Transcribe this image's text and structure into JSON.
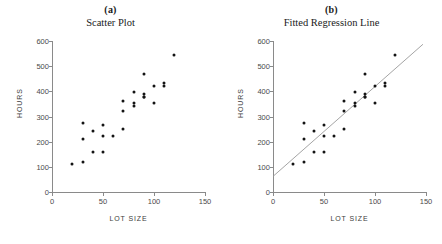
{
  "figure": {
    "background": "#ffffff",
    "point_color": "#141414",
    "axis_color": "#8a8a8a",
    "line_color": "#9a9a9a"
  },
  "panels": [
    {
      "letter": "(a)",
      "title": "Scatter Plot",
      "show_line": false
    },
    {
      "letter": "(b)",
      "title": "Fitted Regression Line",
      "show_line": true
    }
  ],
  "axes": {
    "xlabel": "LOT SIZE",
    "ylabel": "HOURS",
    "xlim": [
      0,
      150
    ],
    "ylim": [
      0,
      600
    ],
    "xticks": [
      0,
      50,
      100,
      150
    ],
    "xticklabels": [
      "0",
      "50",
      "100",
      "150"
    ],
    "yticks": [
      0,
      100,
      200,
      300,
      400,
      500,
      600
    ],
    "yticklabels": [
      "0",
      "100",
      "200",
      "300",
      "400",
      "500",
      "600"
    ],
    "grid": false
  },
  "chart_data": {
    "type": "scatter",
    "xlabel": "LOT SIZE",
    "ylabel": "HOURS",
    "xlim": [
      0,
      150
    ],
    "ylim": [
      0,
      600
    ],
    "grid": false,
    "legend": "none",
    "x": [
      80,
      30,
      50,
      90,
      70,
      60,
      120,
      80,
      100,
      50,
      40,
      70,
      90,
      20,
      110,
      100,
      30,
      50,
      90,
      110,
      30,
      90,
      40,
      80,
      70
    ],
    "y": [
      399,
      121,
      221,
      376,
      361,
      224,
      546,
      352,
      353,
      157,
      160,
      252,
      389,
      113,
      435,
      420,
      212,
      268,
      377,
      421,
      273,
      468,
      244,
      342,
      323
    ],
    "points": [
      {
        "x": 80,
        "y": 399
      },
      {
        "x": 30,
        "y": 121
      },
      {
        "x": 50,
        "y": 221
      },
      {
        "x": 90,
        "y": 376
      },
      {
        "x": 70,
        "y": 361
      },
      {
        "x": 60,
        "y": 224
      },
      {
        "x": 120,
        "y": 546
      },
      {
        "x": 80,
        "y": 352
      },
      {
        "x": 100,
        "y": 353
      },
      {
        "x": 50,
        "y": 157
      },
      {
        "x": 40,
        "y": 160
      },
      {
        "x": 70,
        "y": 252
      },
      {
        "x": 90,
        "y": 389
      },
      {
        "x": 20,
        "y": 113
      },
      {
        "x": 110,
        "y": 435
      },
      {
        "x": 100,
        "y": 420
      },
      {
        "x": 30,
        "y": 212
      },
      {
        "x": 50,
        "y": 268
      },
      {
        "x": 90,
        "y": 377
      },
      {
        "x": 110,
        "y": 421
      },
      {
        "x": 30,
        "y": 273
      },
      {
        "x": 90,
        "y": 468
      },
      {
        "x": 40,
        "y": 244
      },
      {
        "x": 80,
        "y": 342
      },
      {
        "x": 70,
        "y": 323
      }
    ],
    "fit_line": {
      "name": "Fitted Regression Line",
      "intercept": 62.37,
      "slope": 3.5702,
      "x_start": 0,
      "y_start": 62,
      "x_end": 147,
      "y_end": 587
    }
  }
}
